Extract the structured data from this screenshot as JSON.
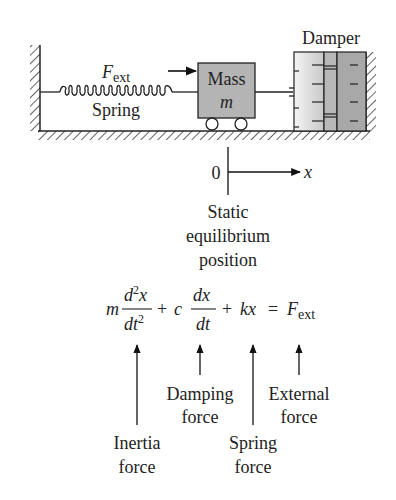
{
  "diagram": {
    "type": "mass-spring-damper system",
    "labels": {
      "force": "F",
      "force_sub": "ext",
      "spring": "Spring",
      "mass": "Mass",
      "mass_symbol": "m",
      "damper": "Damper",
      "origin": "0",
      "axis": "x",
      "equilibrium_line1": "Static",
      "equilibrium_line2": "equilibrium",
      "equilibrium_line3": "position"
    },
    "equation": {
      "m": "m",
      "d2x": "d",
      "d2x_sup": "2",
      "d2x_var": "x",
      "dt2": "dt",
      "dt2_sup": "2",
      "plus1": "+",
      "c": "c",
      "dx": "dx",
      "dt": "dt",
      "plus2": "+",
      "kx": "kx",
      "equals": "=",
      "F": "F",
      "F_sub": "ext"
    },
    "annotations": {
      "inertia_line1": "Inertia",
      "inertia_line2": "force",
      "damping_line1": "Damping",
      "damping_line2": "force",
      "spring_line1": "Spring",
      "spring_line2": "force",
      "external_line1": "External",
      "external_line2": "force"
    },
    "colors": {
      "line": "#222222",
      "mass_fill": "#b4b4b4",
      "damper_light": "#e6e6e6",
      "damper_mid": "#b8b8b8",
      "damper_dark": "#a8a8a8"
    }
  }
}
